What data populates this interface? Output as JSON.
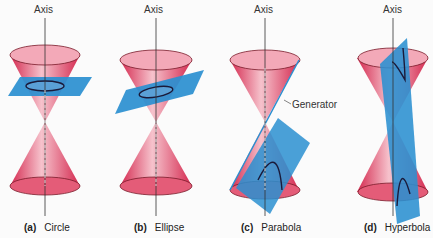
{
  "figures": [
    {
      "letter": "(a)",
      "name": "Circle",
      "axis_label": "Axis"
    },
    {
      "letter": "(b)",
      "name": "Ellipse",
      "axis_label": "Axis"
    },
    {
      "letter": "(c)",
      "name": "Parabola",
      "axis_label": "Axis",
      "annotation": "Generator"
    },
    {
      "letter": "(d)",
      "name": "Hyperbola",
      "axis_label": "Axis"
    }
  ],
  "colors": {
    "cone": "#d83a5a",
    "plane": "#2a8fd0",
    "curve": "#1a1a3a",
    "axis": "#333333"
  }
}
